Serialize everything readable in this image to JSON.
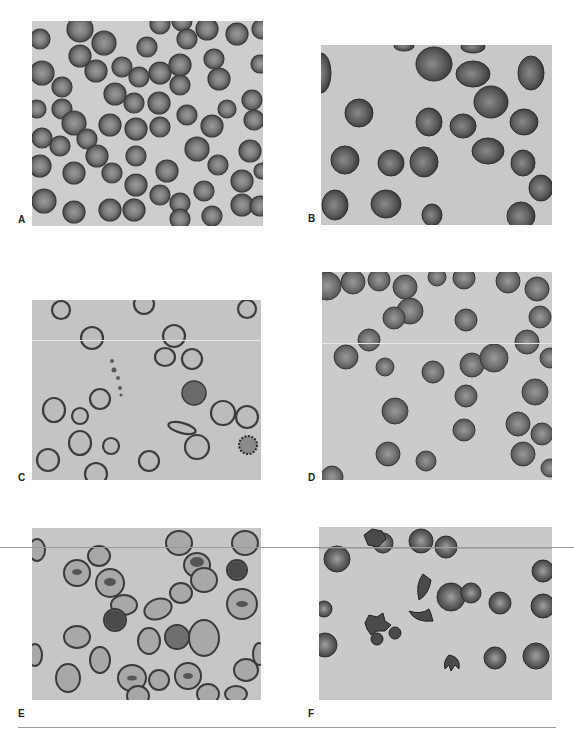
{
  "figure": {
    "panels": [
      {
        "id": "A",
        "label": "A",
        "description": "Dense field of normal round red blood cells"
      },
      {
        "id": "B",
        "label": "B",
        "description": "Sparse oval/elliptical red blood cells"
      },
      {
        "id": "C",
        "label": "C",
        "description": "Pale ring-form cells with few crenated cells"
      },
      {
        "id": "D",
        "label": "D",
        "description": "Round red blood cells with central pallor"
      },
      {
        "id": "E",
        "label": "E",
        "description": "Target-like and folded red blood cells"
      },
      {
        "id": "F",
        "label": "F",
        "description": "Fragmented, spiculated and small dense cells"
      }
    ],
    "caption": ""
  }
}
